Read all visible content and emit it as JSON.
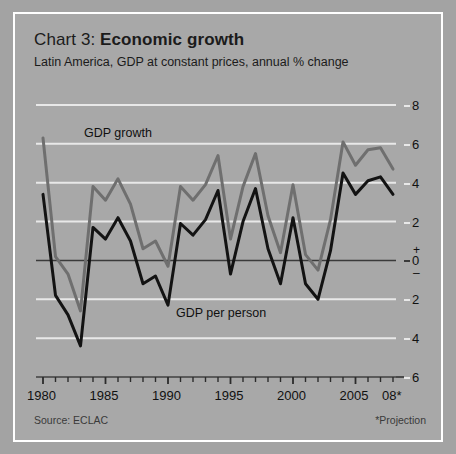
{
  "header": {
    "title_prefix": "Chart 3: ",
    "title_main": "Economic growth",
    "subtitle": "Latin America, GDP at constant prices, annual % change"
  },
  "footer": {
    "source": "Source: ECLAC",
    "note": "*Projection"
  },
  "annotations": {
    "growth_label": "GDP growth",
    "person_label": "GDP per person"
  },
  "axis": {
    "y_ticks": [
      "8",
      "6",
      "4",
      "2",
      "0",
      "2",
      "4",
      "6"
    ],
    "plus_sign": "+",
    "minus_sign": "–",
    "x_ticks": [
      "1980",
      "1985",
      "1990",
      "1995",
      "2000",
      "2005",
      "08*"
    ]
  },
  "colors": {
    "background": "#a3a3a3",
    "panel": "#a8a8a8",
    "frame": "#ffffff",
    "gridline": "#e8e8e8",
    "zeroline": "#3a3a3a",
    "gdp_growth": "#6f6f6f",
    "gdp_per_person": "#131313",
    "text": "#111111"
  },
  "chart_data": {
    "type": "line",
    "title": "Chart 3: Economic growth",
    "subtitle": "Latin America, GDP at constant prices, annual % change",
    "xlabel": "",
    "ylabel": "annual % change",
    "ylim": [
      -6,
      8
    ],
    "xlim": [
      1980,
      2008
    ],
    "grid": true,
    "legend": "inline-annotations",
    "x": [
      1980,
      1981,
      1982,
      1983,
      1984,
      1985,
      1986,
      1987,
      1988,
      1989,
      1990,
      1991,
      1992,
      1993,
      1994,
      1995,
      1996,
      1997,
      1998,
      1999,
      2000,
      2001,
      2002,
      2003,
      2004,
      2005,
      2006,
      2007,
      2008
    ],
    "series": [
      {
        "name": "GDP growth",
        "color": "#6f6f6f",
        "values": [
          6.3,
          0.2,
          -0.7,
          -2.6,
          3.8,
          3.1,
          4.2,
          2.9,
          0.6,
          1.0,
          -0.3,
          3.8,
          3.1,
          3.9,
          5.4,
          1.1,
          3.8,
          5.5,
          2.3,
          0.4,
          3.9,
          0.3,
          -0.5,
          2.1,
          6.1,
          4.9,
          5.7,
          5.8,
          4.7
        ]
      },
      {
        "name": "GDP per person",
        "color": "#131313",
        "values": [
          3.4,
          -1.8,
          -2.8,
          -4.4,
          1.7,
          1.1,
          2.2,
          1.0,
          -1.2,
          -0.8,
          -2.3,
          1.9,
          1.3,
          2.1,
          3.6,
          -0.7,
          2.0,
          3.7,
          0.6,
          -1.2,
          2.2,
          -1.2,
          -2.0,
          0.5,
          4.5,
          3.4,
          4.1,
          4.3,
          3.4
        ]
      }
    ],
    "annotations": [
      {
        "text": "GDP growth",
        "x": 1984,
        "y": 7.0
      },
      {
        "text": "GDP per person",
        "x": 1992,
        "y": -3.0
      }
    ],
    "source": "Source: ECLAC",
    "note": "*Projection"
  }
}
